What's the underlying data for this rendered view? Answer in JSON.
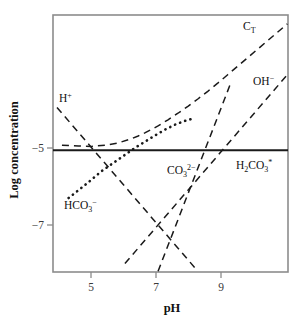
{
  "chart_data": {
    "type": "line",
    "title": "",
    "subtitle": "",
    "xlabel": "pH",
    "ylabel": "Log concentration",
    "xlim": [
      3.83,
      10.92
    ],
    "ylim": [
      -8.22,
      -1.55
    ],
    "xticks": [
      5,
      7,
      9
    ],
    "xtick_labels": [
      "5",
      "7",
      "9"
    ],
    "yticks": [
      -5,
      -7
    ],
    "ytick_labels": [
      "−5",
      "−7"
    ],
    "grid": false,
    "legend": "inline-annotations",
    "frame": "box",
    "series": [
      {
        "name": "C_T",
        "label_parts": {
          "base": "C",
          "sub": "T",
          "sup": ""
        },
        "style": "dashed",
        "label_x": 9.9,
        "label_y": -2.1,
        "x": [
          4.1,
          4.6,
          5.0,
          5.4,
          5.8,
          6.2,
          6.4,
          6.6,
          6.8,
          7.0,
          7.3,
          7.6,
          7.9,
          8.2,
          8.5,
          8.8,
          9.1,
          9.4,
          9.7,
          10.0,
          10.3,
          10.6,
          10.9
        ],
        "y": [
          -4.93,
          -4.95,
          -4.96,
          -4.93,
          -4.87,
          -4.76,
          -4.69,
          -4.61,
          -4.52,
          -4.43,
          -4.27,
          -4.1,
          -3.92,
          -3.73,
          -3.53,
          -3.32,
          -3.1,
          -2.88,
          -2.66,
          -2.44,
          -2.22,
          -2.0,
          -1.78
        ]
      },
      {
        "name": "H+",
        "label_parts": {
          "base": "H",
          "sub": "",
          "sup": "+"
        },
        "style": "dashed",
        "label_x": 4.35,
        "label_y": -3.2,
        "x": [
          3.95,
          8.15
        ],
        "y": [
          -3.95,
          -8.15
        ]
      },
      {
        "name": "OH-",
        "label_parts": {
          "base": "OH",
          "sub": "",
          "sup": "−"
        },
        "style": "dashed",
        "label_x": 10.05,
        "label_y": -3.45,
        "x": [
          6.0,
          10.9
        ],
        "y": [
          -8.0,
          -3.1
        ]
      },
      {
        "name": "HCO3-",
        "label_parts": {
          "base": "HCO",
          "sub": "3",
          "sup": "−"
        },
        "style": "dotted",
        "label_x": 4.55,
        "label_y": -6.55,
        "x": [
          4.3,
          4.8,
          5.3,
          5.8,
          6.3,
          6.6,
          6.9,
          7.2,
          7.5,
          7.8,
          8.05
        ],
        "y": [
          -6.3,
          -5.96,
          -5.6,
          -5.3,
          -5.0,
          -4.84,
          -4.68,
          -4.53,
          -4.4,
          -4.3,
          -4.24
        ]
      },
      {
        "name": "CO3 2-",
        "label_parts": {
          "base": "CO",
          "sub": "3",
          "sup": "2−"
        },
        "style": "dashed",
        "label_x": 7.35,
        "label_y": -5.6,
        "x": [
          7.0,
          9.2
        ],
        "y": [
          -8.2,
          -3.3
        ]
      },
      {
        "name": "H2CO3*",
        "label_parts": {
          "base": "H",
          "sub": "2",
          "base2": "CO",
          "sub2": "3",
          "sup": "*"
        },
        "style": "solid",
        "label_x": 9.45,
        "label_y": -5.45,
        "x": [
          3.83,
          10.92
        ],
        "y": [
          -5.06,
          -5.06
        ]
      }
    ],
    "annotations": [
      {
        "text": "C_T",
        "x": 9.9,
        "y": -2.1
      },
      {
        "text": "OH−",
        "x": 10.05,
        "y": -3.45
      },
      {
        "text": "H+",
        "x": 4.35,
        "y": -3.2
      },
      {
        "text": "CO3 2−",
        "x": 7.35,
        "y": -5.6
      },
      {
        "text": "H2CO3*",
        "x": 9.45,
        "y": -5.45
      },
      {
        "text": "HCO3−",
        "x": 4.55,
        "y": -6.55
      }
    ]
  },
  "labels": {
    "ylabel": "Log concentration",
    "xlabel": "pH",
    "ytick_minus5": "−5",
    "ytick_minus7": "−7",
    "xtick_5": "5",
    "xtick_7": "7",
    "xtick_9": "9",
    "ct_base": "C",
    "ct_sub": "T",
    "oh_base": "OH",
    "oh_sup": "−",
    "h_base": "H",
    "h_sup": "+",
    "co3_base": "CO",
    "co3_sub": "3",
    "co3_sup": "2−",
    "h2co3_base": "H",
    "h2co3_sub": "2",
    "h2co3_base2": "CO",
    "h2co3_sub2": "3",
    "h2co3_sup": "*",
    "hco3_base": "HCO",
    "hco3_sub": "3",
    "hco3_sup": "−"
  },
  "colors": {
    "curve": "#1a1a1a",
    "frame": "#8c8c8c",
    "text": "#111111",
    "background": "#ffffff"
  }
}
